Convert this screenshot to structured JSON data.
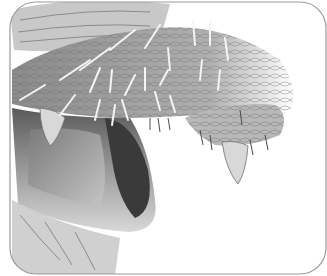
{
  "image": {
    "subject": "grayscale anatomical illustration of a scaly bristled lip and mouth",
    "colors": {
      "background": "#ffffff",
      "frame": "#9a9a9a",
      "scale_dark": "#6e6e6e",
      "scale_mid": "#a8a8a8",
      "scale_light": "#d4d4d4",
      "bristle": "#f4f4f4",
      "cavity": "#3a3a3a"
    }
  }
}
